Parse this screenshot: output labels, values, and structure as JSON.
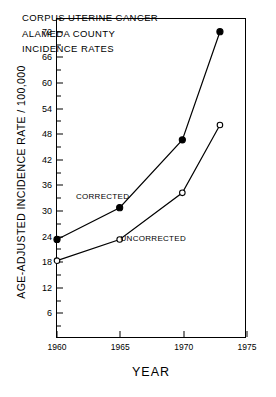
{
  "chart_data": {
    "type": "line",
    "title": "CORPUS UTERINE CANCER ALAMEDA COUNTY INCIDENCE RATES",
    "title_lines": [
      "CORPUS UTERINE CANCER",
      "ALAMEDA  COUNTY",
      "INCIDENCE  RATES"
    ],
    "xlabel": "YEAR",
    "ylabel": "AGE-ADJUSTED INCIDENCE RATE / 100,000",
    "x": [
      1960,
      1965,
      1970,
      1973
    ],
    "xlim": [
      1960,
      1975
    ],
    "ylim": [
      0,
      75
    ],
    "grid": false,
    "legend_position": "inline-annotations",
    "xticks": [
      1960,
      1965,
      1970,
      1975
    ],
    "xtick_labels": [
      "1960",
      "1965",
      "1970",
      "1975"
    ],
    "yticks": [
      6,
      12,
      18,
      24,
      30,
      36,
      42,
      48,
      54,
      60,
      66,
      72
    ],
    "ytick_labels": [
      "6",
      "12",
      "18",
      "24",
      "30",
      "36",
      "42",
      "48",
      "54",
      "60",
      "66",
      "72"
    ],
    "yticks_minor": [
      3,
      9,
      15,
      21,
      27,
      33,
      39,
      45,
      51,
      57,
      63,
      69,
      75
    ],
    "series": [
      {
        "name": "CORRECTED",
        "marker": "filled-circle",
        "color": "#000000",
        "values": [
          23,
          30.5,
          46.5,
          72
        ]
      },
      {
        "name": "UNCORRECTED",
        "marker": "open-circle",
        "color": "#000000",
        "values": [
          18,
          23,
          34,
          50
        ]
      }
    ],
    "annotations": [
      {
        "text": "CORRECTED",
        "x": 1963.6,
        "y": 33.5
      },
      {
        "text": "UNCORRECTED",
        "x": 1967.6,
        "y": 23.6
      }
    ]
  }
}
